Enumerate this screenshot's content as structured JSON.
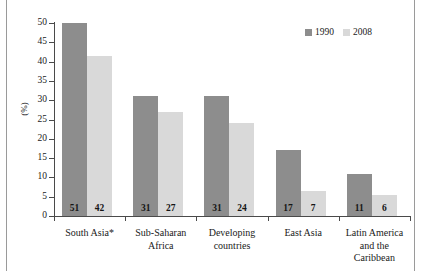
{
  "chart_data": {
    "type": "bar",
    "title": "",
    "xlabel": "",
    "ylabel": "(%)",
    "ylim": [
      0,
      50
    ],
    "ytick_step": 5,
    "yticks": [
      50,
      45,
      40,
      35,
      30,
      25,
      20,
      15,
      10,
      5,
      0
    ],
    "grid": false,
    "legend_position": "top-right",
    "categories": [
      "South Asia*",
      "Sub-Saharan Africa",
      "Developing countries",
      "East Asia",
      "Latin America and the Caribbean"
    ],
    "category_lines": [
      [
        "South Asia*"
      ],
      [
        "Sub-Saharan",
        "Africa"
      ],
      [
        "Developing",
        "countries"
      ],
      [
        "East Asia"
      ],
      [
        "Latin America",
        "and the",
        "Caribbean"
      ]
    ],
    "series": [
      {
        "name": "1990",
        "color": "#8d8d8d",
        "values": [
          50,
          31,
          31,
          17,
          11
        ],
        "labels": [
          "51",
          "31",
          "31",
          "17",
          "11"
        ]
      },
      {
        "name": "2008",
        "color": "#d9d9d9",
        "values": [
          41.5,
          27,
          24,
          6.5,
          5.5
        ],
        "labels": [
          "42",
          "27",
          "24",
          "7",
          "6"
        ]
      }
    ]
  },
  "legend": {
    "items": [
      {
        "label": "1990",
        "color": "#8d8d8d"
      },
      {
        "label": "2008",
        "color": "#d9d9d9"
      }
    ]
  },
  "axis": {
    "y_title": "(%)"
  }
}
